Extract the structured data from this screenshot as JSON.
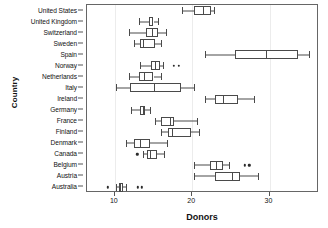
{
  "chart_data": {
    "type": "box",
    "title": "",
    "xlabel": "Donors",
    "ylabel": "Country",
    "xlim": [
      6.4,
      36.4
    ],
    "xticks": [
      10,
      20,
      30
    ],
    "xticklabels": [
      "10",
      "20",
      "30"
    ],
    "grid": "vertical-light",
    "legend": "none",
    "categories": [
      "United States",
      "United Kingdom",
      "Switzerland",
      "Sweden",
      "Spain",
      "Norway",
      "Netherlands",
      "Italy",
      "Ireland",
      "Germany",
      "France",
      "Finland",
      "Denmark",
      "Canada",
      "Belgium",
      "Austria",
      "Australia"
    ],
    "boxes": [
      {
        "country": "United States",
        "min": 18.7,
        "q1": 20.3,
        "median": 21.4,
        "q3": 22.4,
        "max": 22.8,
        "outliers": []
      },
      {
        "country": "United Kingdom",
        "min": 13.1,
        "q1": 14.4,
        "median": 14.8,
        "q3": 15.0,
        "max": 15.6,
        "outliers": []
      },
      {
        "country": "Switzerland",
        "min": 11.8,
        "q1": 14.0,
        "median": 14.8,
        "q3": 15.6,
        "max": 16.6,
        "outliers": []
      },
      {
        "country": "Sweden",
        "min": 12.5,
        "q1": 13.2,
        "median": 13.6,
        "q3": 15.2,
        "max": 16.0,
        "outliers": []
      },
      {
        "country": "Spain",
        "min": 21.6,
        "q1": 25.6,
        "median": 29.5,
        "q3": 33.7,
        "max": 35.1,
        "outliers": []
      },
      {
        "country": "Norway",
        "min": 13.3,
        "q1": 14.7,
        "median": 15.2,
        "q3": 15.9,
        "max": 16.2,
        "outliers": [
          17.6,
          18.3
        ]
      },
      {
        "country": "Netherlands",
        "min": 11.8,
        "q1": 13.1,
        "median": 13.8,
        "q3": 15.0,
        "max": 16.0,
        "outliers": []
      },
      {
        "country": "Italy",
        "min": 10.2,
        "q1": 11.9,
        "median": 15.1,
        "q3": 18.5,
        "max": 20.3,
        "outliers": []
      },
      {
        "country": "Ireland",
        "min": 21.6,
        "q1": 22.9,
        "median": 24.0,
        "q3": 25.9,
        "max": 28.0,
        "outliers": []
      },
      {
        "country": "Germany",
        "min": 12.1,
        "q1": 13.2,
        "median": 13.6,
        "q3": 13.9,
        "max": 14.6,
        "outliers": []
      },
      {
        "country": "France",
        "min": 15.2,
        "q1": 16.0,
        "median": 17.1,
        "q3": 17.7,
        "max": 20.6,
        "outliers": []
      },
      {
        "country": "Finland",
        "min": 16.0,
        "q1": 16.9,
        "median": 17.4,
        "q3": 19.8,
        "max": 20.9,
        "outliers": []
      },
      {
        "country": "Denmark",
        "min": 11.4,
        "q1": 12.5,
        "median": 13.2,
        "q3": 14.6,
        "max": 16.7,
        "outliers": []
      },
      {
        "country": "Canada",
        "min": 13.7,
        "q1": 14.1,
        "median": 14.6,
        "q3": 15.4,
        "max": 16.3,
        "outliers": [
          12.9
        ]
      },
      {
        "country": "Belgium",
        "min": 20.3,
        "q1": 22.3,
        "median": 23.1,
        "q3": 24.0,
        "max": 24.8,
        "outliers": [
          26.8,
          27.4
        ]
      },
      {
        "country": "Austria",
        "min": 20.3,
        "q1": 22.9,
        "median": 25.2,
        "q3": 26.2,
        "max": 28.5,
        "outliers": []
      },
      {
        "country": "Australia",
        "min": 10.1,
        "q1": 10.5,
        "median": 10.7,
        "q3": 11.1,
        "max": 11.4,
        "outliers": [
          9.1,
          13.0,
          13.5
        ]
      }
    ]
  }
}
